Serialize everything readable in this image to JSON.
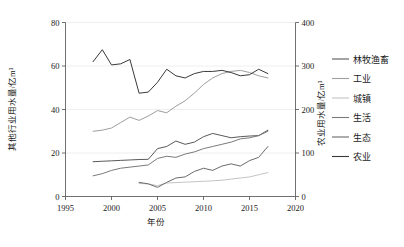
{
  "chart_data": {
    "type": "line",
    "title": "",
    "xlabel": "年份",
    "ylabel_left": "其他行业用水量/亿m³",
    "ylabel_right": "农业用水量/亿m³",
    "xlim": [
      1995,
      2020
    ],
    "xticks": [
      1995,
      2000,
      2005,
      2010,
      2015,
      2020
    ],
    "xtick_labels": [
      "1995",
      "2000",
      "2005",
      "2010",
      "2015",
      "2020"
    ],
    "ylim_left": [
      0,
      80
    ],
    "yticks_left": [
      0,
      20,
      40,
      60,
      80
    ],
    "ytick_labels_left": [
      "0",
      "20",
      "40",
      "60",
      "80"
    ],
    "ylim_right": [
      0,
      400
    ],
    "yticks_right": [
      0,
      100,
      200,
      300,
      400
    ],
    "ytick_labels_right": [
      "0",
      "100",
      "200",
      "300",
      "400"
    ],
    "grid": "horizontal",
    "legend_position": "right-outside",
    "series": [
      {
        "name": "林牧渔畜",
        "axis": "left",
        "color": "#595959",
        "x": [
          1998,
          1999,
          2000,
          2001,
          2002,
          2003,
          2004,
          2005,
          2006,
          2007,
          2008,
          2009,
          2010,
          2011,
          2012,
          2013,
          2014,
          2015,
          2016,
          2017
        ],
        "values": [
          16.0,
          16.2,
          16.4,
          16.6,
          16.8,
          17.0,
          17.1,
          22.0,
          23.0,
          25.5,
          24.0,
          25.0,
          27.5,
          29.0,
          28.0,
          27.0,
          27.5,
          27.8,
          28.0,
          30.5
        ]
      },
      {
        "name": "工业",
        "axis": "left",
        "color": "#9e9e9e",
        "x": [
          1998,
          1999,
          2000,
          2001,
          2002,
          2003,
          2004,
          2005,
          2006,
          2007,
          2008,
          2009,
          2010,
          2011,
          2012,
          2013,
          2014,
          2015,
          2016,
          2017
        ],
        "values": [
          30.0,
          30.5,
          31.5,
          34.0,
          36.5,
          35.0,
          37.0,
          39.5,
          38.5,
          41.5,
          44.0,
          47.5,
          51.5,
          54.5,
          56.5,
          57.5,
          58.0,
          57.0,
          55.5,
          54.5
        ]
      },
      {
        "name": "城镇",
        "axis": "left",
        "color": "#c4c4c4",
        "x": [
          2003,
          2004,
          2005,
          2006,
          2007,
          2008,
          2009,
          2010,
          2011,
          2012,
          2013,
          2014,
          2015,
          2016,
          2017
        ],
        "values": [
          6.0,
          5.8,
          5.0,
          6.2,
          6.4,
          6.6,
          6.8,
          7.0,
          7.2,
          7.5,
          8.0,
          8.5,
          9.0,
          10.0,
          11.0
        ]
      },
      {
        "name": "生活",
        "axis": "left",
        "color": "#7a7a7a",
        "x": [
          1998,
          1999,
          2000,
          2001,
          2002,
          2003,
          2004,
          2005,
          2006,
          2007,
          2008,
          2009,
          2010,
          2011,
          2012,
          2013,
          2014,
          2015,
          2016,
          2017
        ],
        "values": [
          9.5,
          10.5,
          12.0,
          13.0,
          13.5,
          14.0,
          14.5,
          17.5,
          18.5,
          18.0,
          19.5,
          20.5,
          22.0,
          23.0,
          24.0,
          25.0,
          26.5,
          27.0,
          28.0,
          30.0
        ]
      },
      {
        "name": "生态",
        "axis": "left",
        "color": "#6b6b6b",
        "x": [
          2003,
          2004,
          2005,
          2006,
          2007,
          2008,
          2009,
          2010,
          2011,
          2012,
          2013,
          2014,
          2015,
          2016,
          2017
        ],
        "values": [
          6.5,
          5.8,
          4.2,
          6.5,
          8.5,
          9.0,
          11.5,
          13.0,
          12.0,
          14.0,
          15.0,
          14.0,
          16.5,
          18.0,
          23.0
        ]
      },
      {
        "name": "农业",
        "axis": "left",
        "color": "#3a3a3a",
        "x": [
          1998,
          1999,
          2000,
          2001,
          2002,
          2003,
          2004,
          2005,
          2006,
          2007,
          2008,
          2009,
          2010,
          2011,
          2012,
          2013,
          2014,
          2015,
          2016,
          2017
        ],
        "values": [
          62.0,
          67.5,
          60.5,
          61.0,
          63.0,
          47.5,
          48.0,
          52.5,
          58.5,
          55.5,
          54.5,
          56.5,
          57.5,
          57.5,
          58.0,
          57.0,
          55.5,
          56.0,
          58.5,
          56.5
        ]
      }
    ]
  },
  "legend": {
    "items": [
      {
        "label": "林牧渔畜",
        "color": "#595959"
      },
      {
        "label": "工业",
        "color": "#9e9e9e"
      },
      {
        "label": "城镇",
        "color": "#c4c4c4"
      },
      {
        "label": "生活",
        "color": "#7a7a7a"
      },
      {
        "label": "生态",
        "color": "#6b6b6b"
      },
      {
        "label": "农业",
        "color": "#3a3a3a"
      }
    ]
  }
}
